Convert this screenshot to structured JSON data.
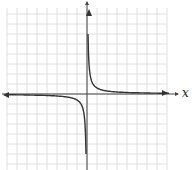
{
  "chart_data": {
    "type": "line",
    "title": "",
    "xlabel": "x",
    "ylabel": "y",
    "function": "y = k/x (hyperbola, k > 0)",
    "grid": true,
    "grid_cells": {
      "x": 16,
      "y": 16
    },
    "xlim": [
      -8,
      8
    ],
    "ylim": [
      -8,
      8
    ],
    "asymptotes": {
      "vertical": "x = 0",
      "horizontal": "y = 0"
    },
    "series": [
      {
        "name": "branch-positive",
        "x": [
          0.08,
          0.25,
          0.5,
          1,
          2,
          4,
          7.6
        ],
        "y": [
          7.6,
          2.4,
          1.2,
          0.6,
          0.3,
          0.15,
          0.08
        ]
      },
      {
        "name": "branch-negative",
        "x": [
          -8,
          -4,
          -2,
          -1,
          -0.5,
          -0.25,
          -0.08
        ],
        "y": [
          -0.08,
          -0.15,
          -0.3,
          -0.6,
          -1.2,
          -2.4,
          -8
        ]
      }
    ]
  },
  "labels": {
    "x_axis": "x",
    "y_axis": "y"
  },
  "colors": {
    "grid": "#d8d8d8",
    "axis": "#444444",
    "curve": "#333333"
  }
}
